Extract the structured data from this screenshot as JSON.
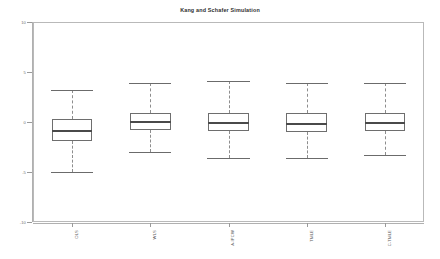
{
  "chart_data": {
    "type": "box",
    "title": "Kang and Schafer Simulation",
    "xlabel": "",
    "ylabel": "",
    "ylim": [
      -10,
      10
    ],
    "yticks": [
      10,
      5,
      0,
      -5,
      -10
    ],
    "ytick_labels": [
      "10",
      "5",
      "0",
      "-5",
      "-10"
    ],
    "grid": false,
    "legend": null,
    "categories": [
      "OLS",
      "WLS",
      "A-IPCW",
      "TMLE",
      "C-TMLE"
    ],
    "boxes": [
      {
        "name": "OLS",
        "whisker_low": -5.0,
        "q1": -1.9,
        "median": -0.85,
        "q3": 0.35,
        "whisker_high": 3.2
      },
      {
        "name": "WLS",
        "whisker_low": -3.0,
        "q1": -0.8,
        "median": 0.05,
        "q3": 0.95,
        "whisker_high": 3.9
      },
      {
        "name": "A-IPCW",
        "whisker_low": -3.6,
        "q1": -0.85,
        "median": -0.05,
        "q3": 0.95,
        "whisker_high": 4.15
      },
      {
        "name": "TMLE",
        "whisker_low": -3.6,
        "q1": -1.0,
        "median": -0.15,
        "q3": 0.9,
        "whisker_high": 3.9
      },
      {
        "name": "C-TMLE",
        "whisker_low": -3.3,
        "q1": -0.85,
        "median": -0.1,
        "q3": 0.95,
        "whisker_high": 3.9
      }
    ]
  },
  "style": {
    "frame_color": "#b9b9b9",
    "box_border_color": "#6e6e6e",
    "median_color": "#4a4a4a",
    "whisker_color": "#8d8d8d",
    "background": "#ffffff"
  }
}
